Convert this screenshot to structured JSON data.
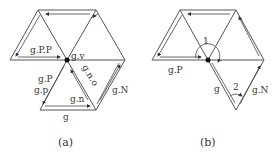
{
  "panels": [
    {
      "caption": "(a)",
      "labels": {
        "g_PP": "g.P.P",
        "g_v": "g.v",
        "g_P": "g.P",
        "g_p": "g.p",
        "g_n_o": "g.n.o",
        "g_n": "g.n",
        "g": "g",
        "g_N": "g.N"
      }
    },
    {
      "caption": "(b)",
      "labels": {
        "g_P": "g.P",
        "g": "g",
        "g_N": "g.N",
        "angle1": "1",
        "angle2": "2"
      }
    }
  ]
}
